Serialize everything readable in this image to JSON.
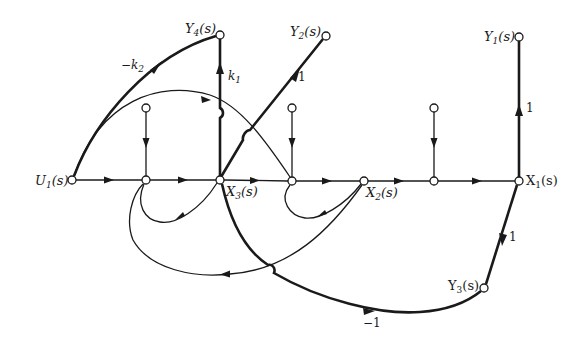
{
  "diagram": {
    "type": "signal-flow-graph",
    "nodes": [
      {
        "id": "U1",
        "label": "U",
        "sub": "1",
        "suffix": "(s)",
        "x": 72,
        "y": 180
      },
      {
        "id": "n1",
        "label": "",
        "x": 146,
        "y": 180
      },
      {
        "id": "X3",
        "label": "X",
        "sub": "3",
        "suffix": "(s)",
        "x": 220,
        "y": 180
      },
      {
        "id": "n2",
        "label": "",
        "x": 292,
        "y": 181
      },
      {
        "id": "X2",
        "label": "X",
        "sub": "2",
        "suffix": "(s)",
        "x": 364,
        "y": 181
      },
      {
        "id": "n3",
        "label": "",
        "x": 434,
        "y": 181
      },
      {
        "id": "X1",
        "label": "X",
        "sub": "1",
        "suffix": "(s)",
        "x": 519,
        "y": 181
      },
      {
        "id": "in1",
        "label": "",
        "x": 146,
        "y": 108
      },
      {
        "id": "in2",
        "label": "",
        "x": 292,
        "y": 108
      },
      {
        "id": "in3",
        "label": "",
        "x": 434,
        "y": 108
      },
      {
        "id": "Y4",
        "label": "Y",
        "sub": "4",
        "suffix": "(s)",
        "x": 220,
        "y": 35
      },
      {
        "id": "Y2",
        "label": "Y",
        "sub": "2",
        "suffix": "(s)",
        "x": 326,
        "y": 36
      },
      {
        "id": "Y1",
        "label": "Y",
        "sub": "1",
        "suffix": "(s)",
        "x": 519,
        "y": 37
      },
      {
        "id": "Y3",
        "label": "Y",
        "sub": "3",
        "suffix": "(s)",
        "x": 484,
        "y": 288
      }
    ],
    "gains": {
      "U1_Y4": "−k",
      "U1_Y4_sub": "2",
      "X3_Y4": "k",
      "X3_Y4_sub": "1",
      "X3_Y2": "1",
      "X1_Y1": "1",
      "X1_Y3": "1",
      "X3_Y3": "−1"
    },
    "labels": {
      "U1": "U",
      "U1_sub": "1",
      "X3": "X",
      "X3_sub": "3",
      "X2": "X",
      "X2_sub": "2",
      "X1": "X",
      "X1_sub": "1",
      "Y4": "Y",
      "Y4_sub": "4",
      "Y2": "Y",
      "Y2_sub": "2",
      "Y1": "Y",
      "Y1_sub": "1",
      "Y3": "Y",
      "Y3_sub": "3",
      "arg": "(s)"
    },
    "edges": [
      {
        "from": "U1",
        "to": "n1",
        "style": "thin"
      },
      {
        "from": "n1",
        "to": "X3",
        "style": "thin"
      },
      {
        "from": "X3",
        "to": "n2",
        "style": "thin"
      },
      {
        "from": "n2",
        "to": "X2",
        "style": "thin"
      },
      {
        "from": "X2",
        "to": "n3",
        "style": "thin"
      },
      {
        "from": "n3",
        "to": "X1",
        "style": "thin"
      },
      {
        "from": "in1",
        "to": "n1",
        "style": "thin"
      },
      {
        "from": "in2",
        "to": "n2",
        "style": "thin"
      },
      {
        "from": "in3",
        "to": "n3",
        "style": "thin"
      },
      {
        "from": "U1",
        "to": "Y4",
        "gain": "-k2",
        "style": "thick"
      },
      {
        "from": "X3",
        "to": "Y4",
        "gain": "k1",
        "style": "thick"
      },
      {
        "from": "X3",
        "to": "Y2",
        "gain": "1",
        "style": "thick"
      },
      {
        "from": "X1",
        "to": "Y1",
        "gain": "1",
        "style": "thick"
      },
      {
        "from": "X1",
        "to": "Y3",
        "gain": "1",
        "style": "thick"
      },
      {
        "from": "X3",
        "to": "Y3",
        "gain": "-1",
        "style": "thick"
      },
      {
        "from": "U1",
        "to": "n2",
        "style": "thin"
      },
      {
        "from": "X3",
        "to": "n1",
        "style": "thin"
      },
      {
        "from": "X2",
        "to": "n2",
        "style": "thin"
      },
      {
        "from": "X2",
        "to": "n1",
        "style": "thin"
      }
    ]
  }
}
